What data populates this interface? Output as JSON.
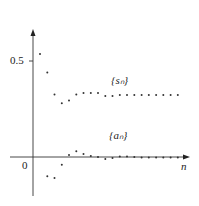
{
  "chart_data": {
    "type": "scatter",
    "title": "",
    "xlabel": "n",
    "ylabel": "",
    "y_ticks": [
      {
        "value": 0.5,
        "label": "0.5"
      }
    ],
    "origin_label": "0",
    "grid": false,
    "legend": "inline labels",
    "ylim": [
      -0.2,
      0.65
    ],
    "series": [
      {
        "name": "{s_n}",
        "label": "{sₙ}",
        "n": [
          1,
          2,
          3,
          4,
          5,
          6,
          7,
          8,
          9,
          10,
          11,
          12,
          13,
          14,
          15,
          16,
          17,
          18,
          19,
          20
        ],
        "values": [
          0.536,
          0.44,
          0.325,
          0.28,
          0.295,
          0.325,
          0.333,
          0.333,
          0.333,
          0.318,
          0.318,
          0.323,
          0.323,
          0.323,
          0.323,
          0.323,
          0.323,
          0.323,
          0.323,
          0.323
        ]
      },
      {
        "name": "{a_n}",
        "label": "{aₙ}",
        "n": [
          2,
          3,
          4,
          5,
          6,
          7,
          8,
          9,
          10,
          11,
          12,
          13,
          14,
          15,
          16,
          17,
          18,
          19,
          20
        ],
        "values": [
          -0.1,
          -0.11,
          -0.04,
          0.01,
          0.03,
          0.015,
          0.005,
          0.0,
          -0.01,
          -0.005,
          0.003,
          0.003,
          0.0,
          -0.003,
          -0.003,
          -0.003,
          -0.003,
          -0.003,
          -0.003
        ]
      }
    ]
  },
  "labels": {
    "y_tick_05": "0.5",
    "origin": "0",
    "x_axis": "n",
    "s_series": "{sₙ}",
    "a_series": "{aₙ}"
  }
}
